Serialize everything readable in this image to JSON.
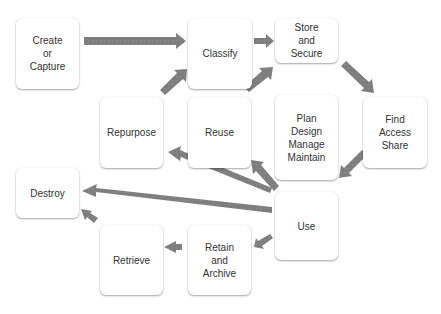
{
  "diagram": {
    "title": "",
    "type": "lifecycle-flow",
    "arrow_color": "#808080",
    "nodes": [
      {
        "id": "create",
        "label": "Create\nor\nCapture"
      },
      {
        "id": "classify",
        "label": "Classify"
      },
      {
        "id": "store",
        "label": "Store\nand\nSecure"
      },
      {
        "id": "repurpose",
        "label": "Repurpose"
      },
      {
        "id": "reuse",
        "label": "Reuse"
      },
      {
        "id": "plan",
        "label": "Plan\nDesign\nManage\nMaintain"
      },
      {
        "id": "find",
        "label": "Find\nAccess\nShare"
      },
      {
        "id": "destroy",
        "label": "Destroy"
      },
      {
        "id": "use",
        "label": "Use"
      },
      {
        "id": "retrieve",
        "label": "Retrieve"
      },
      {
        "id": "retain",
        "label": "Retain\nand\nArchive"
      }
    ],
    "edges": [
      {
        "from": "create",
        "to": "classify"
      },
      {
        "from": "classify",
        "to": "store"
      },
      {
        "from": "store",
        "to": "find"
      },
      {
        "from": "find",
        "to": "use"
      },
      {
        "from": "use",
        "to": "reuse"
      },
      {
        "from": "use",
        "to": "repurpose"
      },
      {
        "from": "use",
        "to": "destroy"
      },
      {
        "from": "use",
        "to": "retain"
      },
      {
        "from": "retain",
        "to": "retrieve"
      },
      {
        "from": "retrieve",
        "to": "destroy"
      },
      {
        "from": "reuse",
        "to": "store"
      },
      {
        "from": "repurpose",
        "to": "classify"
      }
    ]
  }
}
